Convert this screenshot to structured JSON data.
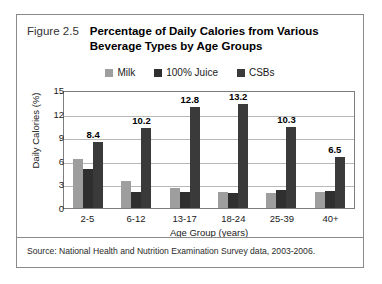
{
  "figure": {
    "number": "Figure 2.5",
    "title_line1": "Percentage of Daily Calories from Various",
    "title_line2": "Beverage Types by Age Groups",
    "source": "Source: National Health and Nutrition Examination Survey data, 2003-2006."
  },
  "colors": {
    "milk": "#9e9e9e",
    "juice": "#2f2f2f",
    "csbs": "#3a3a3a",
    "gridline": "#b8b8b8",
    "axis": "#7d7d7d",
    "border": "#8a8a8a"
  },
  "chart_data": {
    "type": "bar",
    "title": "Percentage of Daily Calories from Various Beverage Types by Age Groups",
    "xlabel": "Age Group (years)",
    "ylabel": "Daily Calories (%)",
    "ylim": [
      0,
      15
    ],
    "yticks": [
      0,
      3,
      6,
      9,
      12,
      15
    ],
    "ytick_labels": [
      "0",
      "3",
      "6",
      "9",
      "12",
      "15"
    ],
    "grid": true,
    "legend_position": "top-center",
    "categories": [
      "2-5",
      "6-12",
      "13-17",
      "18-24",
      "25-39",
      "40+"
    ],
    "series": [
      {
        "name": "Milk",
        "values": [
          6.2,
          3.4,
          2.5,
          2.0,
          1.9,
          2.0
        ]
      },
      {
        "name": "100% Juice",
        "values": [
          5.0,
          2.0,
          2.0,
          1.9,
          2.3,
          2.2
        ]
      },
      {
        "name": "CSBs",
        "values": [
          8.4,
          10.2,
          12.8,
          13.2,
          10.3,
          6.5
        ]
      }
    ],
    "data_labels": [
      "8.4",
      "10.2",
      "12.8",
      "13.2",
      "10.3",
      "6.5"
    ],
    "data_label_series": "CSBs"
  }
}
